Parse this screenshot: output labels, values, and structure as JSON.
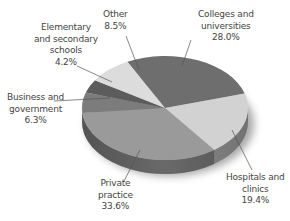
{
  "chart_data": {
    "type": "pie",
    "style": "3d-exploded-none",
    "title": "",
    "categories": [
      "Colleges and universities",
      "Hospitals and clinics",
      "Private practice",
      "Business and government",
      "Elementary and secondary schools",
      "Other"
    ],
    "values": [
      28.0,
      19.4,
      33.6,
      6.3,
      4.2,
      8.5
    ],
    "unit": "%",
    "colors": [
      "#6e6e6e",
      "#d2d2d2",
      "#9a9a9a",
      "#7c7c7c",
      "#5c5c5c",
      "#dcdcdc"
    ],
    "legend": "none (leader-line labels)"
  },
  "labels": [
    {
      "lines": [
        "Colleges and",
        "universities"
      ],
      "value": "28.0%"
    },
    {
      "lines": [
        "Hospitals and",
        "clinics"
      ],
      "value": "19.4%"
    },
    {
      "lines": [
        "Private",
        "practice"
      ],
      "value": "33.6%"
    },
    {
      "lines": [
        "Business and",
        "government"
      ],
      "value": "6.3%"
    },
    {
      "lines": [
        "Elementary",
        "and secondary",
        "schools"
      ],
      "value": "4.2%"
    },
    {
      "lines": [
        "Other"
      ],
      "value": "8.5%"
    }
  ]
}
